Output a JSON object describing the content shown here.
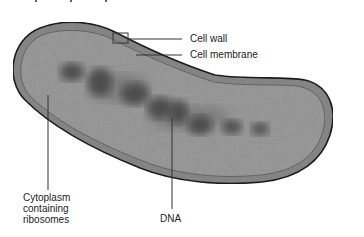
{
  "diagram": {
    "labels": {
      "cell_wall": "Cell wall",
      "cell_membrane": "Cell membrane",
      "cytoplasm": "Cytoplasm\ncontaining\nribosomes",
      "dna": "DNA"
    },
    "colors": {
      "cell_wall": "#8a8a8a",
      "cell_outline": "#1e1e1e",
      "cytoplasm": "#9c9c9c",
      "dna": "#3a3a3a",
      "leader_line": "#333333",
      "text": "#222222"
    }
  }
}
